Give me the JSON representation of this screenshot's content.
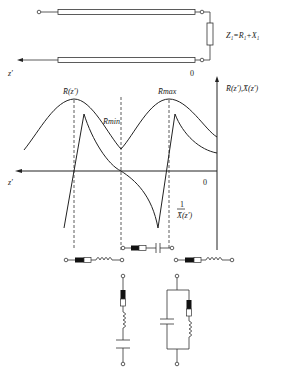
{
  "transmission_line": {
    "load_label": "Z₁=R₁+X₁",
    "axis_label": "z′",
    "origin_label": "0"
  },
  "graph": {
    "y_axis_label": "R̄(z′),X̄(z′)",
    "x_axis_label": "z′",
    "origin_label": "0",
    "curve_r_label": "R̄(z′)",
    "r_max_label": "R̄max",
    "r_min_label": "R̄min",
    "curve_x_label_num": "1",
    "curve_x_label_den": "X̄(z′)"
  },
  "circuits": {
    "series_rc": "resistor + capacitor in series",
    "series_rl_left": "resistor + inductor in series",
    "series_rl_right": "resistor + inductor in series",
    "series_rlc": "resistor + inductor + capacitor in series (vertical)",
    "parallel_c_rl": "capacitor in parallel with series resistor-inductor"
  }
}
